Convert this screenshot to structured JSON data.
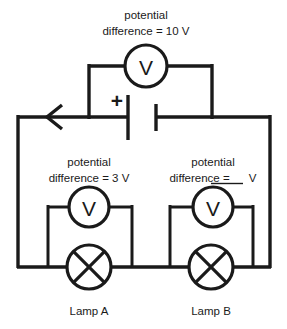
{
  "diagram": {
    "background_color": "#ffffff",
    "line_color": "#1a1a1a"
  },
  "source": {
    "label": "battery",
    "polarity_marker": "+",
    "current_arrow": "arrow-left",
    "voltmeter_symbol": "V",
    "caption_line1": "potential",
    "caption_line2": "difference = 10 V",
    "value": "10 V"
  },
  "branches": [
    {
      "id": "lamp-a",
      "lamp_label": "Lamp A",
      "voltmeter_symbol": "V",
      "caption_line1": "potential",
      "caption_line2": "difference = 3 V",
      "value": "3 V",
      "is_blank": false
    },
    {
      "id": "lamp-b",
      "lamp_label": "Lamp B",
      "voltmeter_symbol": "V",
      "caption_line1": "potential",
      "caption_line2_prefix": "difference = ",
      "caption_line2_suffix": "V",
      "value": "",
      "is_blank": true
    }
  ]
}
